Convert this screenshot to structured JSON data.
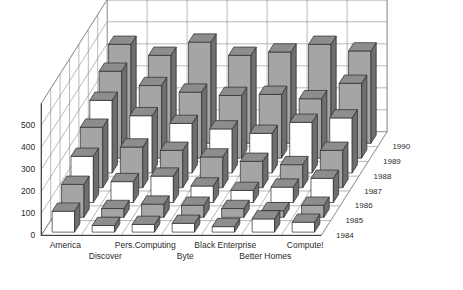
{
  "chart_data": {
    "type": "bar",
    "title": "",
    "subtitle": "",
    "xlabel": "",
    "ylabel": "",
    "zlabel": "",
    "is_3d": true,
    "grid": true,
    "legend_position": "none",
    "categories": [
      "America",
      "Discover",
      "Pers.Computing",
      "Byte",
      "Black Enterprise",
      "Better Homes",
      "Compute!"
    ],
    "depth_categories": [
      "1984",
      "1985",
      "1986",
      "1987",
      "1988",
      "1989",
      "1990"
    ],
    "ytick_labels": [
      "0",
      "100",
      "200",
      "300",
      "400",
      "500"
    ],
    "ytick_values": [
      0,
      100,
      200,
      300,
      400,
      500
    ],
    "ylim": [
      0,
      600
    ],
    "series": [
      {
        "name": "1984",
        "values": [
          95,
          30,
          35,
          40,
          25,
          60,
          45
        ]
      },
      {
        "name": "1985",
        "values": [
          150,
          40,
          60,
          55,
          40,
          30,
          55
        ]
      },
      {
        "name": "1986",
        "values": [
          210,
          95,
          120,
          75,
          55,
          70,
          110
        ]
      },
      {
        "name": "1987",
        "values": [
          275,
          185,
          170,
          140,
          120,
          105,
          170
        ]
      },
      {
        "name": "1988",
        "values": [
          330,
          260,
          225,
          200,
          180,
          230,
          250
        ]
      },
      {
        "name": "1989",
        "values": [
          395,
          330,
          300,
          285,
          290,
          270,
          340
        ]
      },
      {
        "name": "1990",
        "values": [
          450,
          400,
          460,
          400,
          415,
          450,
          420
        ]
      }
    ],
    "series_fills": [
      "#ffffff",
      "#a5a5a5",
      "#ffffff",
      "#a5a5a5",
      "#ffffff",
      "#a5a5a5",
      "#a5a5a5"
    ],
    "colors": {
      "bar_gray": "#a5a5a5",
      "bar_white": "#ffffff",
      "bar_side": "#6e6e6e",
      "bar_top": "#8d8d8d",
      "outline": "#2b2b2b",
      "grid": "#8a8a8a",
      "floor": "#ffffff",
      "text": "#2b2b2b"
    }
  }
}
